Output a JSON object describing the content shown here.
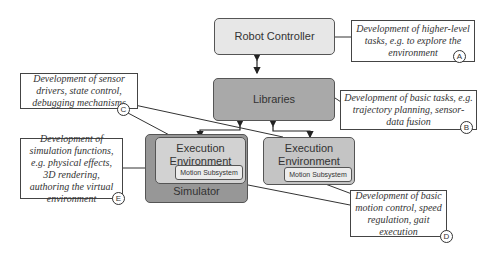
{
  "diagram": {
    "nodes": {
      "robot_controller": "Robot Controller",
      "libraries": "Libraries",
      "simulator": "Simulator",
      "exec_sim": "Execution Environment (sim)",
      "exec_real": "Execution Environment (real)",
      "motion_sim": "Motion Subsystem",
      "motion_real": "Motion Subsystem"
    },
    "annotations": {
      "a": {
        "letter": "A",
        "text": "Development of higher-level tasks, e.g. to explore the environment"
      },
      "b": {
        "letter": "B",
        "text": "Development of basic tasks, e.g. trajectory planning, sensor-data fusion"
      },
      "c": {
        "letter": "C",
        "text": "Development of sensor drivers, state control, debugging mechanisms"
      },
      "d": {
        "letter": "D",
        "text": "Development of basic motion control, speed regulation, gait execution"
      },
      "e": {
        "letter": "E",
        "text": "Development of simulation functions, e.g. physical effects, 3D rendering, authoring the virtual environment"
      }
    },
    "colors": {
      "robot_controller_fill": "#e7e7e7",
      "libraries_fill": "#a9a9a9",
      "simulator_fill": "#979797",
      "exec_sim_fill": "#d2d2d2",
      "exec_real_fill": "#c4c4c4",
      "motion_fill": "#ececec",
      "stroke": "#333333"
    },
    "edges": [
      {
        "from": "robot_controller",
        "to": "libraries",
        "type": "bidirectional-arrow"
      },
      {
        "from": "libraries",
        "to": "exec_sim",
        "type": "bidirectional-arrow"
      },
      {
        "from": "libraries",
        "to": "exec_real",
        "type": "bidirectional-arrow"
      },
      {
        "from": "note_a",
        "to": "robot_controller",
        "type": "line"
      },
      {
        "from": "note_b",
        "to": "libraries",
        "type": "line"
      },
      {
        "from": "note_c",
        "to": "exec_sim",
        "type": "line"
      },
      {
        "from": "note_c",
        "to": "exec_real",
        "type": "line"
      },
      {
        "from": "note_d",
        "to": "motion_sim",
        "type": "line"
      },
      {
        "from": "note_d",
        "to": "motion_real",
        "type": "line"
      },
      {
        "from": "note_e",
        "to": "simulator",
        "type": "line"
      }
    ]
  }
}
